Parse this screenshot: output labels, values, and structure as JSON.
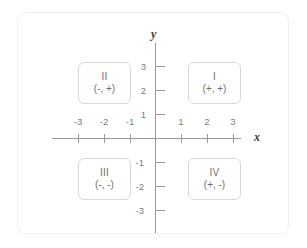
{
  "axes": {
    "x_label": "x",
    "y_label": "y",
    "x_ticks": [
      {
        "value": -3,
        "label": "-3"
      },
      {
        "value": -2,
        "label": "-2"
      },
      {
        "value": -1,
        "label": "-1"
      },
      {
        "value": 1,
        "label": "1"
      },
      {
        "value": 2,
        "label": "2"
      },
      {
        "value": 3,
        "label": "3"
      }
    ],
    "y_ticks": [
      {
        "value": 3,
        "label": "3"
      },
      {
        "value": 2,
        "label": "2"
      },
      {
        "value": 1,
        "label": "1"
      },
      {
        "value": -1,
        "label": "-1"
      },
      {
        "value": -2,
        "label": "-2"
      },
      {
        "value": -3,
        "label": "-3"
      }
    ],
    "axis_color": "#9a9a9a",
    "tick_label_color": "#7d7d7d"
  },
  "quadrants": [
    {
      "roman": "I",
      "signs": "(+, +)"
    },
    {
      "roman": "II",
      "signs": "(-, +)"
    },
    {
      "roman": "III",
      "signs": "(-, -)"
    },
    {
      "roman": "IV",
      "signs": "(+, -)"
    }
  ],
  "style": {
    "frame_border_color": "#f0f0f0",
    "box_border_color": "#d8d8d8",
    "box_text_color": "#6f6f6f",
    "background": "#ffffff"
  }
}
